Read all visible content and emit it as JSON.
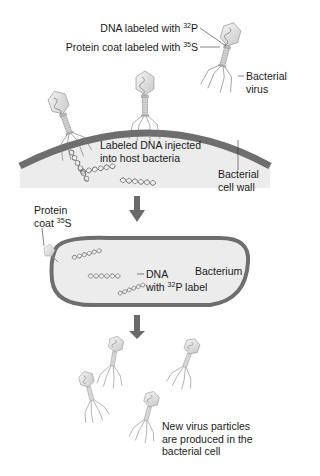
{
  "labels": {
    "dna_label": {
      "pre": "DNA labeled with ",
      "sup": "32",
      "post": "P"
    },
    "protein_label": {
      "pre": "Protein coat labeled with ",
      "sup": "35",
      "post": "S"
    },
    "bacterial_virus": {
      "line1": "Bacterial",
      "line2": "virus"
    },
    "injected": {
      "line1": "Labeled DNA injected",
      "line2": "into host bacteria"
    },
    "cell_wall": {
      "line1": "Bacterial",
      "line2": "cell wall"
    },
    "protein_coat": {
      "line1": "Protein",
      "line2_pre": "coat ",
      "sup": "35",
      "line2_post": "S"
    },
    "bacterium": "Bacterium",
    "dna_with": {
      "line1": "DNA",
      "line2_pre": "with ",
      "sup": "32",
      "line2_post": "P label"
    },
    "new_particles": {
      "line1": "New virus particles",
      "line2": "are produced in the",
      "line3": "bacterial cell"
    }
  },
  "colors": {
    "cell_wall": "#6e6e6e",
    "cytoplasm": "#ececec",
    "arrow": "#6a6a6a",
    "virus_head": "#e4e4e4",
    "line": "#333333"
  }
}
